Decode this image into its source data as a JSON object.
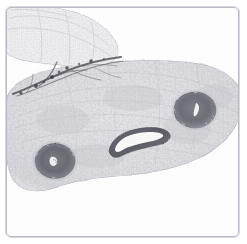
{
  "figure": {
    "kind": "histological-section-photomicrograph",
    "title": "",
    "caption": "",
    "background_color": "#ffffff",
    "frame_color": "#b9bcc4",
    "tissue_tone": "#e9e9ec",
    "structure_tone": "#6f6f74",
    "lumen_tone": "#fdfdfd"
  },
  "specimen": {
    "label": "",
    "outline_note": "",
    "parts": [
      {
        "id": "main-tissue-mass",
        "name": "main-tissue-mass",
        "description": "large elongated ovoid sectioned tissue mass spanning the field",
        "tone": "#e8e8ec"
      },
      {
        "id": "upper-left-appendage",
        "name": "upper-left-appendage",
        "description": "pale irregular lobulated mass overhanging the upper-left border",
        "tone": "#f1f1f3"
      },
      {
        "id": "vessel-right",
        "name": "vessel-right",
        "description": "dark round structure with bright central lumen, upper right",
        "tone": "#74747a",
        "lumen": "#fbfbfb"
      },
      {
        "id": "vessel-left",
        "name": "vessel-left",
        "description": "dark round structure with bright central lumen, lower left",
        "tone": "#6e6e75",
        "lumen": "#fafafa"
      },
      {
        "id": "duct-center",
        "name": "duct-center",
        "description": "curved elongated slit-like duct with white lumen, centre of field",
        "tone": "#68686f",
        "lumen": "#ffffff"
      },
      {
        "id": "stromal-streaks",
        "name": "stromal-streaks",
        "description": "dark branching linear streaks with punctate foci across upper left",
        "tone": "#52525a"
      }
    ]
  },
  "annotations": {
    "markers": [],
    "scale_bar": null,
    "legend": []
  }
}
